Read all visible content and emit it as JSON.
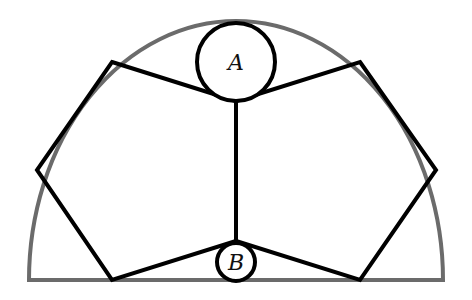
{
  "diagram": {
    "type": "geometry",
    "colors": {
      "arch": "#6b6b6b",
      "lines": "#000000",
      "background": "#ffffff"
    },
    "arch": {
      "cx": 236,
      "cy": 280,
      "rx": 207,
      "ry": 259,
      "baseline_y": 280,
      "x_left": 29,
      "x_right": 443
    },
    "circles": [
      {
        "id": "A",
        "label": "A",
        "cx": 236,
        "cy": 62,
        "r": 39
      },
      {
        "id": "B",
        "label": "B",
        "cx": 236,
        "cy": 262,
        "r": 19
      }
    ],
    "left_pentagon": {
      "points": [
        [
          112,
          62
        ],
        [
          236,
          101
        ],
        [
          236,
          241
        ],
        [
          112,
          280
        ],
        [
          37,
          170
        ]
      ]
    },
    "right_pentagon": {
      "points": [
        [
          360,
          62
        ],
        [
          436,
          170
        ],
        [
          360,
          280
        ],
        [
          236,
          241
        ],
        [
          236,
          101
        ]
      ]
    },
    "labels": {
      "a": "A",
      "b": "B"
    }
  }
}
